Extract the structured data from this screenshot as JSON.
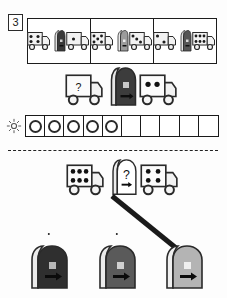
{
  "exercise": {
    "number": "3",
    "type": "visual-analogy-matrix-puzzle"
  },
  "top_panels": [
    {
      "label": "panel-1",
      "left_truck_dots": 4,
      "cargo_color": "#3a3a3a",
      "cargo_shade": "dark",
      "right_truck_dots": 1
    },
    {
      "label": "panel-2",
      "left_truck_dots": 5,
      "cargo_color": "#9b9b9b",
      "cargo_shade": "light",
      "right_truck_dots": 3
    },
    {
      "label": "panel-3",
      "left_truck_dots": 2,
      "cargo_color": "#565656",
      "cargo_shade": "medium",
      "right_truck_dots": 6
    }
  ],
  "middle_row": {
    "left_truck_label": "?",
    "left_truck_dots": 0,
    "cargo_color": "#3c3c3c",
    "cargo_shade": "dark",
    "right_truck_dots": 2
  },
  "count_strip": {
    "icon": "sun-icon",
    "total_cells": 10,
    "filled_cells": 5,
    "empty_cells": 5,
    "marker_shape": "ring"
  },
  "question_row": {
    "left_truck_dots": 6,
    "middle_label": "?",
    "middle_cargo_color": "#ffffff",
    "right_truck_dots": 6
  },
  "answer_options": [
    {
      "label": "option-a",
      "cargo_color": "#2f2f2f",
      "cargo_shade": "dark",
      "selected": false
    },
    {
      "label": "option-b",
      "cargo_color": "#5a5a5a",
      "cargo_shade": "medium",
      "selected": false
    },
    {
      "label": "option-c",
      "cargo_color": "#b4b4b4",
      "cargo_shade": "light",
      "selected": true
    }
  ],
  "colors": {
    "ink": "#1a1a1a",
    "truck_body": "#f2f2f2",
    "truck_outline": "#2a2a2a",
    "page_bg": "#ffffff"
  }
}
